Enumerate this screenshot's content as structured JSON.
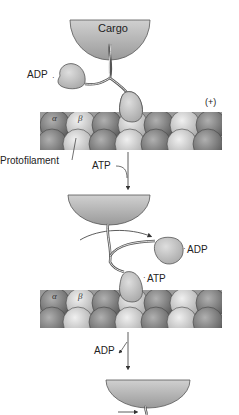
{
  "header_fragment": "",
  "panel1": {
    "cargo_label": "Cargo",
    "adp_label": "ADP",
    "plus_end_label": "(+)",
    "alpha_label": "α",
    "beta_label": "β",
    "protofilament_label": "Protofilament"
  },
  "transition1": {
    "label": "ATP"
  },
  "panel2": {
    "adp_label": "ADP",
    "atp_label": "ATP",
    "alpha_label": "α",
    "beta_label": "β"
  },
  "transition2": {
    "label": "ADP"
  },
  "colors": {
    "cargo": "#b5b5b5",
    "motor_head": "#c4c4c4",
    "tubulin_dark": "#7d7d7d",
    "tubulin_light": "#d6d6d6",
    "outline": "#444444"
  }
}
